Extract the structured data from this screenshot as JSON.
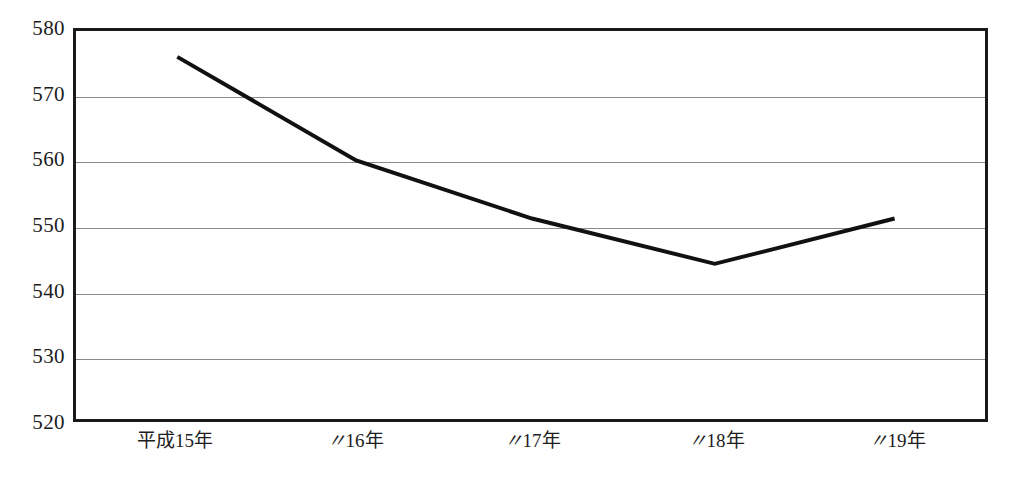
{
  "chart_data": {
    "type": "line",
    "title": "",
    "subtitle": "",
    "xlabel": "",
    "ylabel": "",
    "categories": [
      "平成15年",
      "〃16年",
      "〃17年",
      "〃18年",
      "〃19年"
    ],
    "category_parts": [
      {
        "prefix": "平成",
        "number": "15",
        "suffix": "年",
        "is_ditto": false
      },
      {
        "prefix": "〃",
        "number": "16",
        "suffix": "年",
        "is_ditto": true
      },
      {
        "prefix": "〃",
        "number": "17",
        "suffix": "年",
        "is_ditto": true
      },
      {
        "prefix": "〃",
        "number": "18",
        "suffix": "年",
        "is_ditto": true
      },
      {
        "prefix": "〃",
        "number": "19",
        "suffix": "年",
        "is_ditto": true
      }
    ],
    "values": [
      576,
      560,
      551,
      544,
      551
    ],
    "series": [
      {
        "name": "",
        "values": [
          576,
          560,
          551,
          544,
          551
        ]
      }
    ],
    "ylim": [
      520,
      580
    ],
    "ytick_step": 10,
    "ytick_labels": [
      "580",
      "570",
      "560",
      "550",
      "540",
      "530",
      "520"
    ],
    "ytick_values": [
      580,
      570,
      560,
      550,
      540,
      530,
      520
    ],
    "grid": true,
    "grid_axis": "y",
    "legend": false,
    "legend_position": "none",
    "colors": {
      "series_line": "#111111",
      "gridline": "#8a8a8a",
      "frame": "#1a1a1a",
      "background": "#ffffff",
      "text": "#1d1d1d"
    },
    "geometry": {
      "plot_left": 73,
      "plot_top": 28,
      "plot_width": 915,
      "plot_height": 394,
      "point_x_positions": [
        175,
        355,
        532,
        716,
        897
      ]
    }
  }
}
